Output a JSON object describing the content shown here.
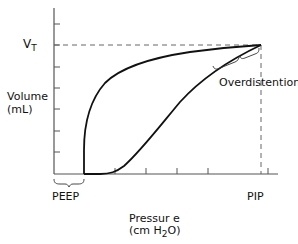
{
  "figure": {
    "y_axis_label_line1": "Volume",
    "y_axis_label_line2": "(mL)",
    "y_top_label_main": "V",
    "y_top_label_sub": "T",
    "x_axis_label_line1": "Pressur e",
    "x_axis_label_line2_pre": "(cm H",
    "x_axis_label_line2_sub": "2",
    "x_axis_label_line2_post": "O)",
    "x_left_label": "PEEP",
    "x_right_label": "PIP",
    "annotation": "Overdistention"
  },
  "colors": {
    "line": "#111111",
    "axis": "#555555",
    "dash": "#666666",
    "background": "#ffffff"
  }
}
